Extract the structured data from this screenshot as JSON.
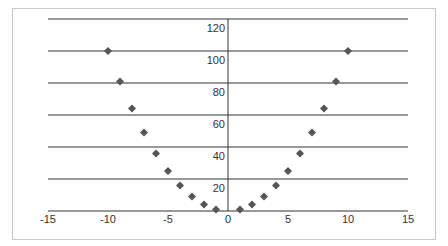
{
  "chart_data": {
    "type": "scatter",
    "title": "",
    "xlabel": "",
    "ylabel": "",
    "xlim": [
      -15,
      15
    ],
    "ylim": [
      0,
      120
    ],
    "x_ticks": [
      -15,
      -10,
      -5,
      0,
      5,
      10,
      15
    ],
    "y_ticks": [
      20,
      40,
      60,
      80,
      100,
      120
    ],
    "grid": "horizontal",
    "legend": "none",
    "marker": "diamond",
    "marker_color": "#555555",
    "series": [
      {
        "name": "y = x^2",
        "x": [
          -10,
          -9,
          -8,
          -7,
          -6,
          -5,
          -4,
          -3,
          -2,
          -1,
          1,
          2,
          3,
          4,
          5,
          6,
          7,
          8,
          9,
          10
        ],
        "y": [
          100,
          81,
          64,
          49,
          36,
          25,
          16,
          9,
          4,
          1,
          1,
          4,
          9,
          16,
          25,
          36,
          49,
          64,
          81,
          100
        ]
      }
    ]
  }
}
